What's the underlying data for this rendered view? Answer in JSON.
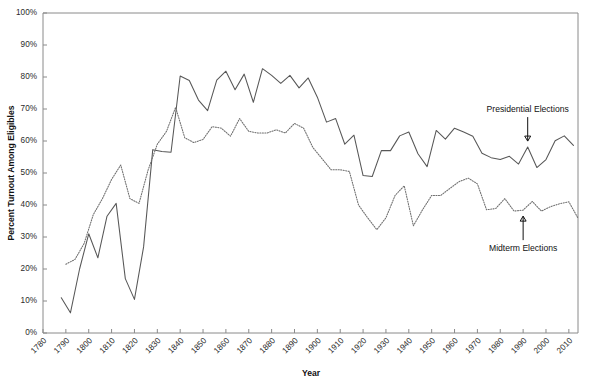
{
  "figure": {
    "cut_off_header_text": "",
    "background_color": "#ffffff",
    "line_color_presidential": "#575757",
    "line_color_midterm": "#6d6d6d"
  },
  "annotations": [
    {
      "name": "presidential-elections",
      "label": "Presidential Elections",
      "points_to_year": 1992,
      "direction": "down"
    },
    {
      "name": "midterm-elections",
      "label": "Midterm Elections",
      "points_to_year": 1990,
      "direction": "up"
    }
  ],
  "chart_data": {
    "type": "line",
    "title": "",
    "xlabel": "Year",
    "ylabel": "Percent Turnout Among Eligibles",
    "xlim": [
      1780,
      2014
    ],
    "ylim": [
      0,
      100
    ],
    "grid": false,
    "legend_position": "inline-annotations",
    "ytick_labels": [
      "0%",
      "10%",
      "20%",
      "30%",
      "40%",
      "50%",
      "60%",
      "70%",
      "80%",
      "90%",
      "100%"
    ],
    "ytick_values": [
      0,
      10,
      20,
      30,
      40,
      50,
      60,
      70,
      80,
      90,
      100
    ],
    "xtick_labels": [
      "1780",
      "1790",
      "1800",
      "1810",
      "1820",
      "1830",
      "1840",
      "1850",
      "1860",
      "1870",
      "1880",
      "1890",
      "1900",
      "1910",
      "1920",
      "1930",
      "1940",
      "1950",
      "1960",
      "1970",
      "1980",
      "1990",
      "2000",
      "2010"
    ],
    "xtick_values": [
      1780,
      1790,
      1800,
      1810,
      1820,
      1830,
      1840,
      1850,
      1860,
      1870,
      1880,
      1890,
      1900,
      1910,
      1920,
      1930,
      1940,
      1950,
      1960,
      1970,
      1980,
      1990,
      2000,
      2010
    ],
    "series": [
      {
        "name": "Presidential Elections",
        "style": "solid",
        "points": [
          [
            1788,
            11.0
          ],
          [
            1792,
            6.3
          ],
          [
            1796,
            20.0
          ],
          [
            1800,
            31.0
          ],
          [
            1804,
            23.5
          ],
          [
            1808,
            36.5
          ],
          [
            1812,
            40.5
          ],
          [
            1816,
            17.0
          ],
          [
            1820,
            10.5
          ],
          [
            1824,
            26.9
          ],
          [
            1828,
            57.3
          ],
          [
            1832,
            56.7
          ],
          [
            1836,
            56.5
          ],
          [
            1840,
            80.3
          ],
          [
            1844,
            78.9
          ],
          [
            1848,
            72.8
          ],
          [
            1852,
            69.5
          ],
          [
            1856,
            79.0
          ],
          [
            1860,
            81.8
          ],
          [
            1864,
            76.0
          ],
          [
            1868,
            80.9
          ],
          [
            1872,
            72.1
          ],
          [
            1876,
            82.6
          ],
          [
            1880,
            80.5
          ],
          [
            1884,
            78.0
          ],
          [
            1888,
            80.5
          ],
          [
            1892,
            76.6
          ],
          [
            1896,
            79.7
          ],
          [
            1900,
            73.7
          ],
          [
            1904,
            65.9
          ],
          [
            1908,
            67.0
          ],
          [
            1912,
            59.0
          ],
          [
            1916,
            61.8
          ],
          [
            1920,
            49.2
          ],
          [
            1924,
            48.9
          ],
          [
            1928,
            57.0
          ],
          [
            1932,
            57.0
          ],
          [
            1936,
            61.6
          ],
          [
            1940,
            62.8
          ],
          [
            1944,
            56.0
          ],
          [
            1948,
            52.0
          ],
          [
            1952,
            63.3
          ],
          [
            1956,
            60.6
          ],
          [
            1960,
            64.0
          ],
          [
            1964,
            62.8
          ],
          [
            1968,
            61.5
          ],
          [
            1972,
            56.2
          ],
          [
            1976,
            54.8
          ],
          [
            1980,
            54.2
          ],
          [
            1984,
            55.2
          ],
          [
            1988,
            52.8
          ],
          [
            1992,
            58.1
          ],
          [
            1996,
            51.7
          ],
          [
            2000,
            54.2
          ],
          [
            2004,
            60.1
          ],
          [
            2008,
            61.6
          ],
          [
            2012,
            58.6
          ]
        ]
      },
      {
        "name": "Midterm Elections",
        "style": "dotted",
        "points": [
          [
            1790,
            21.5
          ],
          [
            1794,
            23.0
          ],
          [
            1798,
            28.0
          ],
          [
            1802,
            37.0
          ],
          [
            1806,
            42.0
          ],
          [
            1810,
            48.0
          ],
          [
            1814,
            52.5
          ],
          [
            1818,
            42.0
          ],
          [
            1822,
            40.5
          ],
          [
            1826,
            51.0
          ],
          [
            1830,
            59.0
          ],
          [
            1834,
            63.0
          ],
          [
            1838,
            70.5
          ],
          [
            1842,
            61.0
          ],
          [
            1846,
            59.5
          ],
          [
            1850,
            60.5
          ],
          [
            1854,
            64.5
          ],
          [
            1858,
            64.0
          ],
          [
            1862,
            61.5
          ],
          [
            1866,
            67.0
          ],
          [
            1870,
            63.0
          ],
          [
            1874,
            62.5
          ],
          [
            1878,
            62.5
          ],
          [
            1882,
            63.5
          ],
          [
            1886,
            62.5
          ],
          [
            1890,
            65.5
          ],
          [
            1894,
            64.0
          ],
          [
            1898,
            58.0
          ],
          [
            1902,
            54.5
          ],
          [
            1906,
            51.0
          ],
          [
            1910,
            51.0
          ],
          [
            1914,
            50.5
          ],
          [
            1918,
            40.0
          ],
          [
            1922,
            36.0
          ],
          [
            1926,
            32.3
          ],
          [
            1930,
            36.0
          ],
          [
            1934,
            43.0
          ],
          [
            1938,
            46.0
          ],
          [
            1942,
            33.5
          ],
          [
            1946,
            38.5
          ],
          [
            1950,
            43.0
          ],
          [
            1954,
            43.0
          ],
          [
            1958,
            45.2
          ],
          [
            1962,
            47.3
          ],
          [
            1966,
            48.4
          ],
          [
            1970,
            46.6
          ],
          [
            1974,
            38.5
          ],
          [
            1978,
            38.9
          ],
          [
            1982,
            42.0
          ],
          [
            1986,
            38.1
          ],
          [
            1990,
            38.4
          ],
          [
            1994,
            41.1
          ],
          [
            1998,
            38.1
          ],
          [
            2002,
            39.5
          ],
          [
            2006,
            40.4
          ],
          [
            2010,
            41.0
          ],
          [
            2014,
            35.9
          ]
        ]
      }
    ]
  }
}
